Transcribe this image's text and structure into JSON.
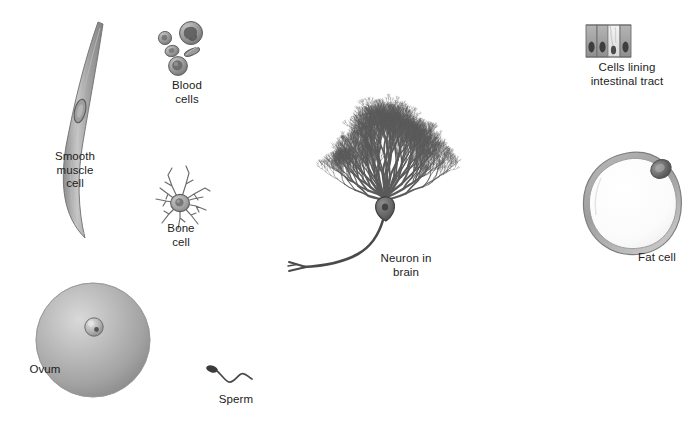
{
  "figure": {
    "background_color": "#ffffff",
    "ink_color": "#4a4a4a",
    "text_color": "#1c1c1c"
  },
  "cells": [
    {
      "id": "smooth-muscle-cell",
      "label": "Smooth\nmuscle\ncell",
      "label_x": 30,
      "label_y": 150,
      "label_w": 90,
      "description": "Long tapered spindle-shaped cell with central elongated nucleus",
      "shade": "#9a9a9a"
    },
    {
      "id": "blood-cells",
      "label": "Blood\ncells",
      "label_x": 150,
      "label_y": 79,
      "label_w": 74,
      "description": "Cluster of red blood cells, a granulocyte and a monocyte",
      "shade": "#8e8e8e"
    },
    {
      "id": "bone-cell",
      "label": "Bone\ncell",
      "label_x": 143,
      "label_y": 222,
      "label_w": 76,
      "description": "Star-shaped osteocyte with radiating processes",
      "shade": "#9c9c9c"
    },
    {
      "id": "neuron-in-brain",
      "label": "Neuron in\nbrain",
      "label_x": 358,
      "label_y": 252,
      "label_w": 96,
      "description": "Purkinje cell with dense fan-shaped dendritic tree and descending axon",
      "shade": "#5d5d5d"
    },
    {
      "id": "cells-lining-intestinal-tract",
      "label": "Cells lining\nintestinal tract",
      "label_x": 562,
      "label_y": 61,
      "label_w": 130,
      "description": "Row of columnar epithelial cells with basal nuclei and a goblet cell",
      "shade": "#9a9a9a"
    },
    {
      "id": "fat-cell",
      "label": "Fat cell",
      "label_x": 622,
      "label_y": 251,
      "label_w": 70,
      "description": "Large rounded adipocyte with lipid droplet and peripheral nucleus",
      "shade": "#a2a2a2"
    },
    {
      "id": "ovum",
      "label": "Ovum",
      "label_x": 14,
      "label_y": 363,
      "label_w": 62,
      "description": "Large shaded spherical egg cell with small nucleus",
      "shade": "#a8a8a8"
    },
    {
      "id": "sperm",
      "label": "Sperm",
      "label_x": 205,
      "label_y": 393,
      "label_w": 62,
      "description": "Small cell with dark oval head and long wavy flagellum",
      "shade": "#4f4f4f"
    }
  ]
}
